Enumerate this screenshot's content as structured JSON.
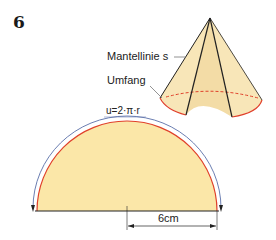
{
  "exercise_number": "6",
  "cone": {
    "labels": {
      "slant_line": "Mantellinie s",
      "circumference": "Umfang"
    }
  },
  "net": {
    "arc_formula": "u=2·π·r",
    "radius_dimension": "6cm"
  },
  "colors": {
    "fill": "#fbe7a8",
    "arc_red": "#e0402a",
    "arc_blue": "#5a6fa8",
    "outline": "#222222"
  }
}
